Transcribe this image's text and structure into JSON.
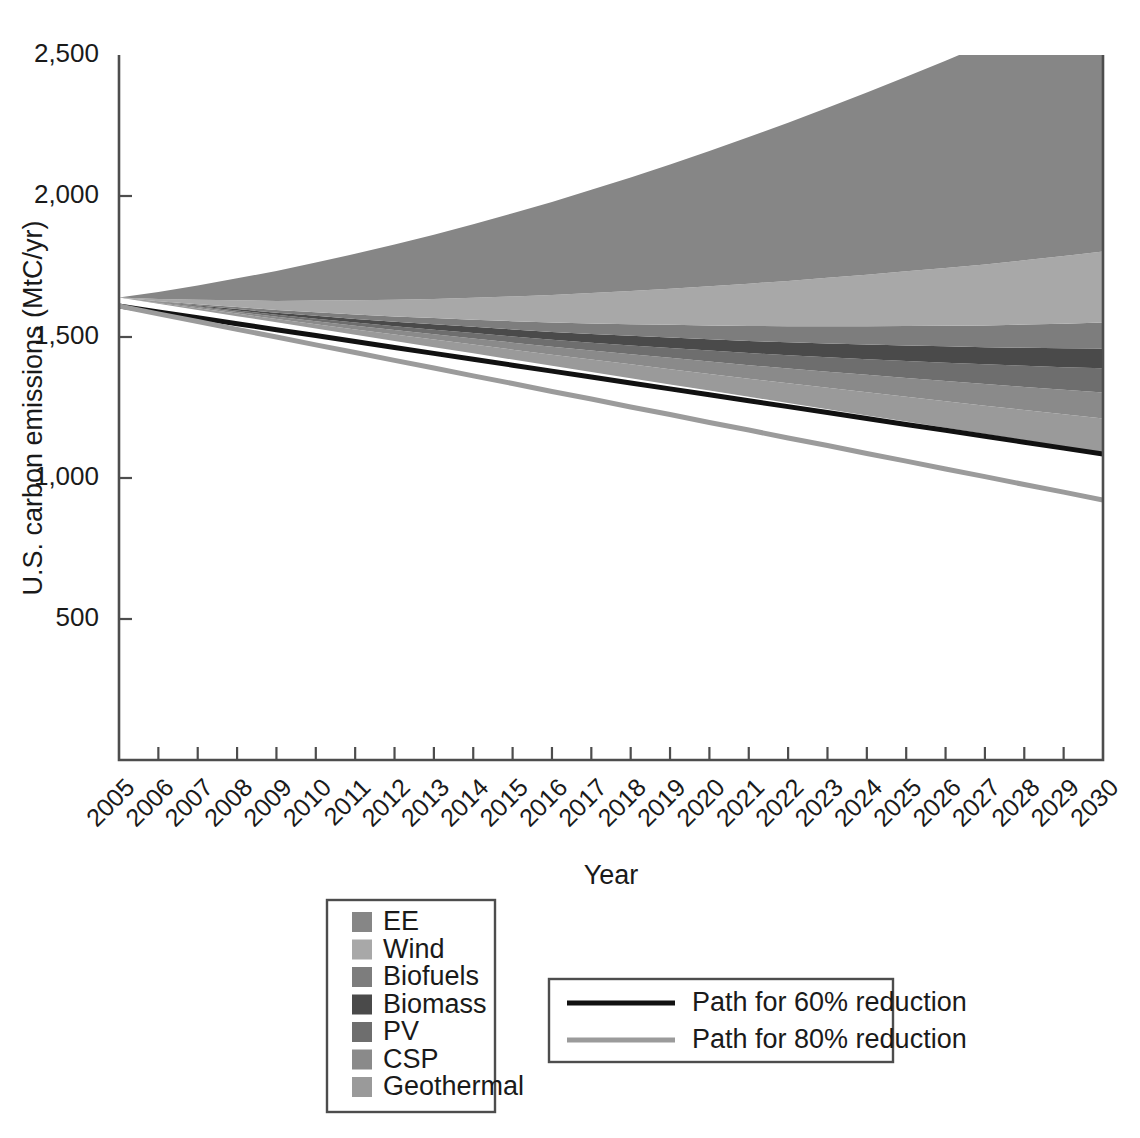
{
  "chart_data": {
    "type": "area",
    "title": "",
    "xlabel": "Year",
    "ylabel": "U.S. carbon emissions (MtC/yr)",
    "xlim": [
      2005,
      2030
    ],
    "ylim": [
      0,
      2500
    ],
    "yticks": [
      500,
      1000,
      1500,
      2000,
      2500
    ],
    "ytick_labels": [
      "500",
      "1,000",
      "1,500",
      "2,000",
      "2,500"
    ],
    "grid": false,
    "legend_position": "below-plot",
    "x": [
      2005,
      2006,
      2007,
      2008,
      2009,
      2010,
      2011,
      2012,
      2013,
      2014,
      2015,
      2016,
      2017,
      2018,
      2019,
      2020,
      2021,
      2022,
      2023,
      2024,
      2025,
      2026,
      2027,
      2028,
      2029,
      2030
    ],
    "xtick_labels": [
      "2005",
      "2006",
      "2007",
      "2008",
      "2009",
      "2010",
      "2011",
      "2012",
      "2013",
      "2014",
      "2015",
      "2016",
      "2017",
      "2018",
      "2019",
      "2020",
      "2021",
      "2022",
      "2023",
      "2024",
      "2025",
      "2026",
      "2027",
      "2028",
      "2029",
      "2030"
    ],
    "stack_baseline": [
      1640,
      1618,
      1596,
      1574,
      1552,
      1530,
      1508,
      1486,
      1464,
      1442,
      1420,
      1398,
      1376,
      1354,
      1332,
      1310,
      1288,
      1266,
      1244,
      1222,
      1200,
      1178,
      1156,
      1134,
      1112,
      1090
    ],
    "series": [
      {
        "name": "Geothermal",
        "color": "#9a9a9a",
        "values": [
          0,
          3,
          6,
          9,
          12,
          15,
          19,
          23,
          27,
          31,
          35,
          39,
          44,
          49,
          54,
          59,
          64,
          70,
          76,
          82,
          88,
          94,
          100,
          107,
          114,
          121
        ]
      },
      {
        "name": "CSP",
        "color": "#8a8a8a",
        "values": [
          0,
          2,
          4,
          6,
          8,
          11,
          13,
          16,
          19,
          22,
          25,
          28,
          32,
          36,
          40,
          44,
          48,
          52,
          57,
          62,
          67,
          72,
          77,
          82,
          87,
          92
        ]
      },
      {
        "name": "PV",
        "color": "#6e6e6e",
        "values": [
          0,
          1,
          3,
          5,
          7,
          9,
          11,
          13,
          16,
          19,
          22,
          25,
          28,
          31,
          35,
          39,
          43,
          47,
          51,
          55,
          60,
          65,
          70,
          75,
          80,
          86
        ]
      },
      {
        "name": "Biomass",
        "color": "#4a4a4a",
        "values": [
          0,
          1,
          3,
          5,
          7,
          10,
          13,
          16,
          19,
          22,
          25,
          28,
          31,
          34,
          37,
          40,
          43,
          46,
          49,
          52,
          55,
          58,
          61,
          64,
          67,
          70
        ]
      },
      {
        "name": "Biofuels",
        "color": "#7d7d7d",
        "values": [
          0,
          2,
          4,
          7,
          10,
          13,
          16,
          19,
          22,
          25,
          29,
          33,
          37,
          41,
          45,
          49,
          53,
          57,
          61,
          65,
          69,
          73,
          77,
          82,
          87,
          92
        ]
      },
      {
        "name": "Wind",
        "color": "#a8a8a8",
        "values": [
          0,
          8,
          16,
          24,
          32,
          41,
          50,
          59,
          68,
          78,
          88,
          98,
          108,
          118,
          128,
          139,
          150,
          161,
          172,
          183,
          194,
          205,
          216,
          228,
          240,
          252
        ]
      },
      {
        "name": "EE",
        "color": "#868686",
        "values": [
          0,
          25,
          51,
          78,
          106,
          135,
          165,
          196,
          228,
          261,
          295,
          330,
          366,
          403,
          441,
          480,
          520,
          561,
          603,
          646,
          690,
          735,
          781,
          828,
          876,
          925
        ]
      }
    ],
    "lines": [
      {
        "name": "Path for 60% reduction",
        "color": "#111111",
        "width": 5,
        "values": [
          1610,
          1589,
          1568,
          1547,
          1526,
          1505,
          1484,
          1463,
          1442,
          1421,
          1400,
          1379,
          1358,
          1337,
          1316,
          1295,
          1274,
          1253,
          1232,
          1211,
          1190,
          1169,
          1148,
          1127,
          1106,
          1085
        ]
      },
      {
        "name": "Path for 80% reduction",
        "color": "#9b9b9b",
        "width": 5,
        "values": [
          1610,
          1582,
          1555,
          1527,
          1500,
          1472,
          1445,
          1417,
          1390,
          1362,
          1335,
          1307,
          1280,
          1252,
          1225,
          1197,
          1170,
          1142,
          1115,
          1087,
          1060,
          1032,
          1005,
          977,
          950,
          922
        ]
      }
    ]
  },
  "legend_area": {
    "items": [
      {
        "label": "EE",
        "color": "#868686"
      },
      {
        "label": "Wind",
        "color": "#a8a8a8"
      },
      {
        "label": "Biofuels",
        "color": "#7d7d7d"
      },
      {
        "label": "Biomass",
        "color": "#4a4a4a"
      },
      {
        "label": "PV",
        "color": "#6e6e6e"
      },
      {
        "label": "CSP",
        "color": "#8a8a8a"
      },
      {
        "label": "Geothermal",
        "color": "#9a9a9a"
      }
    ]
  },
  "legend_lines": {
    "items": [
      {
        "label": "Path for 60% reduction",
        "color": "#111111"
      },
      {
        "label": "Path for 80% reduction",
        "color": "#9b9b9b"
      }
    ]
  }
}
